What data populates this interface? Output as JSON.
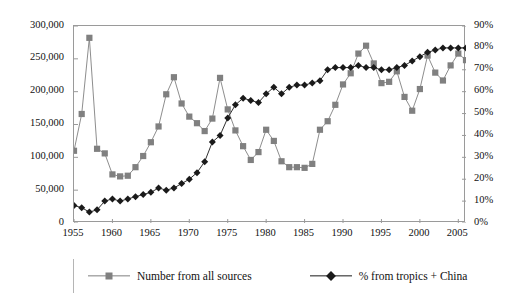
{
  "chart_data": {
    "type": "line",
    "title": "",
    "subtitle": "",
    "xlabel": "",
    "ylabel": "",
    "y2label": "",
    "xlim": [
      1955,
      2006
    ],
    "ylim": [
      0,
      300000
    ],
    "y2lim": [
      0,
      0.9
    ],
    "grid": false,
    "legend_position": "bottom",
    "x_tick_labels": [
      "1955",
      "1960",
      "1965",
      "1970",
      "1975",
      "1980",
      "1985",
      "1990",
      "1995",
      "2000",
      "2005"
    ],
    "x_tick_values": [
      1955,
      1960,
      1965,
      1970,
      1975,
      1980,
      1985,
      1990,
      1995,
      2000,
      2005
    ],
    "y_tick_labels": [
      "0",
      "50,000",
      "100,000",
      "150,000",
      "200,000",
      "250,000",
      "300,000"
    ],
    "y_tick_values": [
      0,
      50000,
      100000,
      150000,
      200000,
      250000,
      300000
    ],
    "y2_tick_labels": [
      "0%",
      "10%",
      "20%",
      "30%",
      "40%",
      "50%",
      "60%",
      "70%",
      "80%",
      "90%"
    ],
    "y2_tick_values": [
      0,
      10,
      20,
      30,
      40,
      50,
      60,
      70,
      80,
      90
    ],
    "x": [
      1955,
      1956,
      1957,
      1958,
      1959,
      1960,
      1961,
      1962,
      1963,
      1964,
      1965,
      1966,
      1967,
      1968,
      1969,
      1970,
      1971,
      1972,
      1973,
      1974,
      1975,
      1976,
      1977,
      1978,
      1979,
      1980,
      1981,
      1982,
      1983,
      1984,
      1985,
      1986,
      1987,
      1988,
      1989,
      1990,
      1991,
      1992,
      1993,
      1994,
      1995,
      1996,
      1997,
      1998,
      1999,
      2000,
      2001,
      2002,
      2003,
      2004,
      2005,
      2006
    ],
    "series": [
      {
        "name": "Number from all sources",
        "axis": "left",
        "color": "#808080",
        "marker": "square",
        "values": [
          110000,
          166000,
          282000,
          113000,
          106000,
          74000,
          71000,
          72000,
          85000,
          102000,
          123000,
          147000,
          196000,
          222000,
          182000,
          162000,
          152000,
          140000,
          159000,
          221000,
          173000,
          141000,
          117000,
          96000,
          108000,
          142000,
          125000,
          94000,
          85000,
          85000,
          84000,
          90000,
          142000,
          155000,
          180000,
          211000,
          228000,
          258000,
          270000,
          243000,
          213000,
          215000,
          231000,
          192000,
          171000,
          204000,
          255000,
          229000,
          217000,
          240000,
          258000,
          248000
        ]
      },
      {
        "name": "% from tropics + China",
        "axis": "right",
        "color": "#1a1a1a",
        "marker": "diamond",
        "values": [
          8,
          7,
          5,
          6,
          10,
          11,
          10,
          11,
          12,
          13,
          14,
          16,
          15,
          16,
          18,
          20,
          23,
          28,
          37,
          40,
          48,
          54,
          57,
          56,
          55,
          59,
          62,
          59,
          62,
          63,
          63,
          64,
          65,
          70,
          71,
          71,
          71,
          72,
          71,
          71,
          70,
          70,
          71,
          72,
          74,
          76,
          78,
          79,
          80,
          80,
          80,
          80
        ]
      }
    ]
  },
  "legend": {
    "entries": [
      {
        "label": "Number from all sources",
        "marker": "square-marker",
        "color": "#808080"
      },
      {
        "label": "% from tropics + China",
        "marker": "diamond-marker",
        "color": "#1a1a1a"
      }
    ]
  }
}
